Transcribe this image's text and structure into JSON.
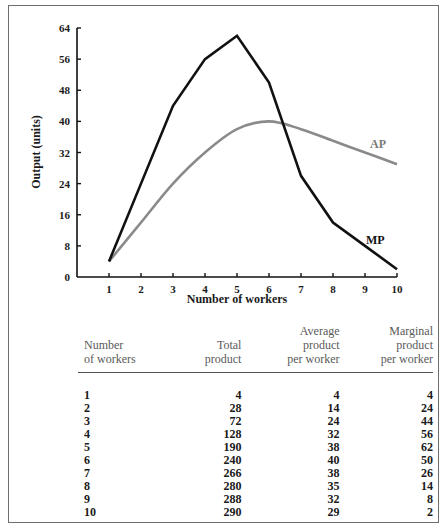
{
  "chart_data": {
    "type": "line",
    "title": "",
    "xlabel": "Number of workers",
    "ylabel": "Output (units)",
    "x": [
      1,
      2,
      3,
      4,
      5,
      6,
      7,
      8,
      9,
      10
    ],
    "xticks": [
      "1",
      "2",
      "3",
      "4",
      "5",
      "6",
      "7",
      "8",
      "9",
      "10"
    ],
    "yticks": [
      "0",
      "8",
      "16",
      "24",
      "32",
      "40",
      "48",
      "56",
      "64"
    ],
    "ylim": [
      0,
      64
    ],
    "xlim": [
      0,
      10
    ],
    "grid": false,
    "legend": "inline labels",
    "series": [
      {
        "name": "MP",
        "label": "MP",
        "color": "#111111",
        "values": [
          4,
          24,
          44,
          56,
          62,
          50,
          26,
          14,
          8,
          2
        ]
      },
      {
        "name": "AP",
        "label": "AP",
        "color": "#8a8a8a",
        "values": [
          4,
          14,
          24,
          32,
          38,
          40,
          38,
          35,
          32,
          29
        ]
      }
    ]
  },
  "table": {
    "headers": [
      [
        "Number",
        "of workers"
      ],
      [
        "Total",
        "product"
      ],
      [
        "Average",
        "product",
        "per worker"
      ],
      [
        "Marginal",
        "product",
        "per worker"
      ]
    ],
    "rows": [
      [
        "1",
        "4",
        "4",
        "4"
      ],
      [
        "2",
        "28",
        "14",
        "24"
      ],
      [
        "3",
        "72",
        "24",
        "44"
      ],
      [
        "4",
        "128",
        "32",
        "56"
      ],
      [
        "5",
        "190",
        "38",
        "62"
      ],
      [
        "6",
        "240",
        "40",
        "50"
      ],
      [
        "7",
        "266",
        "38",
        "26"
      ],
      [
        "8",
        "280",
        "35",
        "14"
      ],
      [
        "9",
        "288",
        "32",
        "8"
      ],
      [
        "10",
        "290",
        "29",
        "2"
      ]
    ]
  }
}
